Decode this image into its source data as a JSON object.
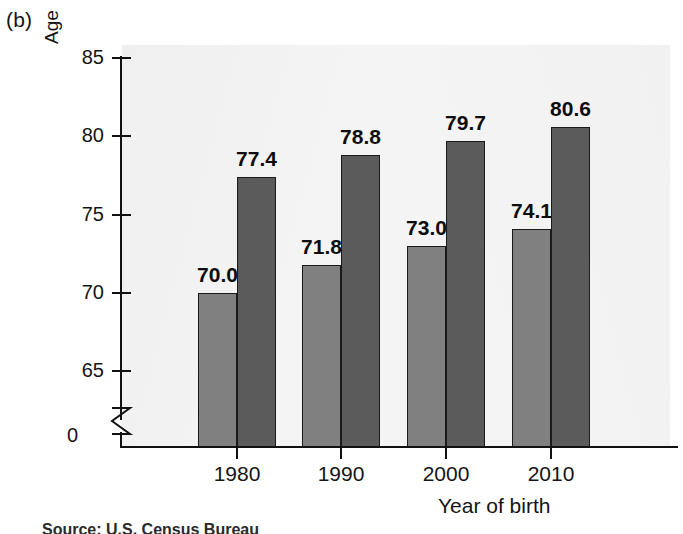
{
  "figure": {
    "panel_label": "(b)",
    "source_note": "Source: U.S. Census Bureau"
  },
  "colors": {
    "series_1": "#808080",
    "series_2": "#595959",
    "plot_background": "#f4f4f4",
    "page_background": "#ffffff",
    "axis": "#111111",
    "text": "#141414"
  },
  "chart_data": {
    "type": "bar",
    "title": "",
    "subtitle": "",
    "xlabel": "Year of birth",
    "ylabel": "Age",
    "categories": [
      "1980",
      "1990",
      "2000",
      "2010"
    ],
    "series": [
      {
        "name": "series-1",
        "color": "#808080",
        "values": [
          70.0,
          71.8,
          73.0,
          74.1
        ],
        "labels": [
          "70.0",
          "71.8",
          "73.0",
          "74.1"
        ]
      },
      {
        "name": "series-2",
        "color": "#595959",
        "values": [
          77.4,
          78.8,
          79.7,
          80.6
        ],
        "labels": [
          "77.4",
          "78.8",
          "79.7",
          "80.6"
        ]
      }
    ],
    "ylim": [
      0,
      85
    ],
    "y_axis_break": true,
    "y_axis_break_between": [
      0,
      63.5
    ],
    "yticks": [
      85,
      80,
      75,
      70,
      65
    ],
    "ytick_labels": [
      "85",
      "80",
      "75",
      "70",
      "65"
    ],
    "y_zero_label": "0",
    "xtick_labels": [
      "1980",
      "1990",
      "2000",
      "2010"
    ],
    "grid": false,
    "legend": null,
    "legend_position": "none"
  }
}
